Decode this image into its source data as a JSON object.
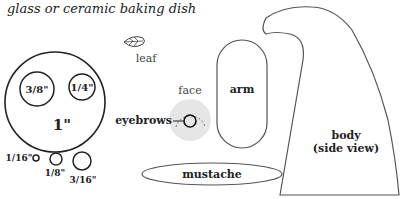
{
  "caption": "glass or ceramic baking dish",
  "pieces": {
    "big_circle": {
      "label": "1\""
    },
    "circle_3_8": {
      "label": "3/8\""
    },
    "circle_1_4": {
      "label": "1/4\""
    },
    "circle_1_16": {
      "label": "1/16\""
    },
    "circle_1_8": {
      "label": "1/8\""
    },
    "circle_3_16": {
      "label": "3/16\""
    },
    "leaf": {
      "label": "leaf"
    },
    "face": {
      "label": "face"
    },
    "eyebrows": {
      "label": "eyebrows"
    },
    "arm": {
      "label": "arm"
    },
    "mustache": {
      "label": "mustache"
    },
    "body": {
      "label_line1": "body",
      "label_line2": "(side view)"
    }
  },
  "colors": {
    "outline": "#333333",
    "face_fill": "#e6e6e6"
  }
}
